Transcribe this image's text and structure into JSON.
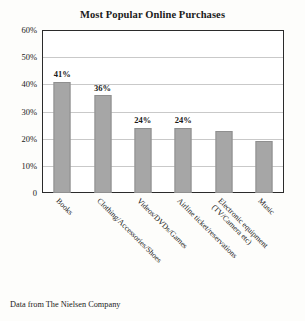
{
  "chart_data": {
    "type": "bar",
    "title": "Most Popular Online Purchases",
    "xlabel": "",
    "ylabel": "",
    "ylim": [
      0,
      60
    ],
    "ytick_labels": [
      "60%",
      "50%",
      "40%",
      "30%",
      "20%",
      "10%",
      "0"
    ],
    "ytick_values": [
      60,
      50,
      40,
      30,
      20,
      10,
      0
    ],
    "grid": true,
    "legend": "none",
    "bar_color": "#a6a6a6",
    "bar_edge_color": "#8f8f8f",
    "categories": [
      "Books",
      "Clothing/Accessories/Shoes",
      "Videos/DVDs/Games",
      "Airline ticket/reservations",
      "Electronic equipment (TV/Camera etc)",
      "Music"
    ],
    "category_lines": [
      [
        "Books"
      ],
      [
        "Clothing/Accessories/Shoes"
      ],
      [
        "Videos/DVDs/Games"
      ],
      [
        "Airline ticket/reservations"
      ],
      [
        "Electronic equipment",
        "(TV/Camera etc)"
      ],
      [
        "Music"
      ]
    ],
    "values": [
      41,
      36,
      24,
      24,
      23,
      19
    ],
    "data_labels": [
      "41%",
      "36%",
      "24%",
      "24%",
      "",
      ""
    ],
    "annotations": [
      "Data from The Nielsen Company"
    ]
  },
  "figure": {
    "title": "Most Popular Online Purchases",
    "source_note": "Data from The Nielsen Company"
  }
}
